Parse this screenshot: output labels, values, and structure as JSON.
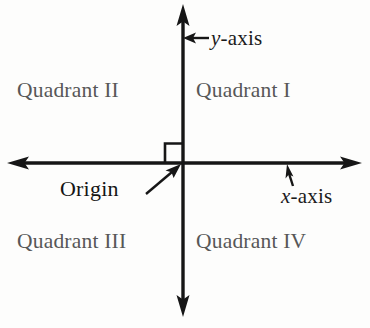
{
  "figure": {
    "type": "cartesian-coordinate-plane",
    "background_color": "#fdfdfc",
    "line_color": "#161616"
  },
  "axes": {
    "x_axis": {
      "label_var": "x",
      "label_suffix": "-axis",
      "label_full": "x-axis",
      "orientation": "horizontal",
      "double_headed": true
    },
    "y_axis": {
      "label_var": "y",
      "label_suffix": "-axis",
      "label_full": "y-axis",
      "orientation": "vertical",
      "double_headed": true
    }
  },
  "origin": {
    "label": "Origin",
    "right_angle_marker": true,
    "marker_quadrant": "II"
  },
  "quadrants": [
    {
      "id": "I",
      "label": "Quadrant I"
    },
    {
      "id": "II",
      "label": "Quadrant II"
    },
    {
      "id": "III",
      "label": "Quadrant III"
    },
    {
      "id": "IV",
      "label": "Quadrant IV"
    }
  ]
}
